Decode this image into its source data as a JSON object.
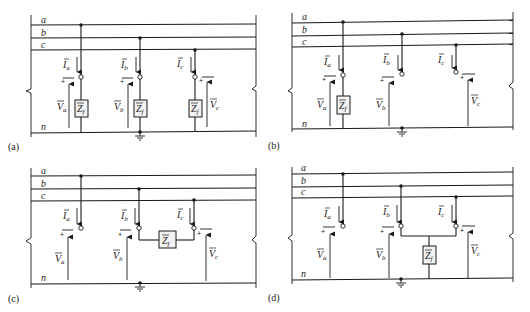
{
  "figure": {
    "conductor_labels": [
      "a",
      "b",
      "c",
      "n"
    ],
    "currents": [
      "I_a",
      "I_b",
      "I_c"
    ],
    "voltages": [
      "V_a",
      "V_b",
      "V_c"
    ],
    "impedance_label": "Z",
    "impedance_sub": "f",
    "panels": [
      {
        "id": "a",
        "caption": "(a)",
        "type": "three-phase-to-ground through Zf each phase"
      },
      {
        "id": "b",
        "caption": "(b)",
        "type": "single line-to-ground (phase a) through Zf"
      },
      {
        "id": "c",
        "caption": "(c)",
        "type": "line-to-line (b-c) through Zf"
      },
      {
        "id": "d",
        "caption": "(d)",
        "type": "double line-to-ground (b-c) through Zf"
      }
    ]
  },
  "labels": {
    "a": "a",
    "b": "b",
    "c": "c",
    "n": "n",
    "Ia": "I",
    "Ib": "I",
    "Ic": "I",
    "Va": "V",
    "Vb": "V",
    "Vc": "V",
    "sub_a": "a",
    "sub_b": "b",
    "sub_c": "c",
    "Z": "Z",
    "f": "f",
    "plus": "+",
    "cap_a": "(a)",
    "cap_b": "(b)",
    "cap_c": "(c)",
    "cap_d": "(d)"
  },
  "colors": {
    "line": "#1a1a1a",
    "box_fill": "#f2f2f2",
    "background": "#ffffff"
  }
}
